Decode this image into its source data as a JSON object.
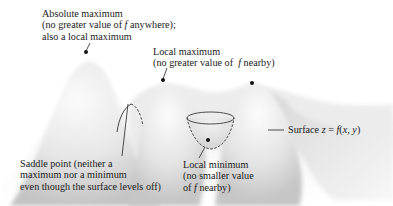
{
  "diagram": {
    "labels": {
      "absolute_max": {
        "lines": [
          "Absolute maximum",
          "(no greater value of f anywhere);",
          "also a local maximum"
        ]
      },
      "local_max": {
        "lines": [
          "Local maximum",
          "(no greater value of  f nearby)"
        ]
      },
      "saddle": {
        "lines": [
          "Saddle point (neither a",
          "maximum nor a minimum",
          "even though the surface levels off)"
        ]
      },
      "local_min": {
        "lines": [
          "Local minimum",
          "(no smaller value",
          "of f nearby)"
        ]
      },
      "surface": {
        "text": "Surface z = f(x, y)"
      }
    },
    "colors": {
      "background": "#ffffff",
      "surface_light": "#f4f4f4",
      "surface_shadow": "#bdbdbd",
      "ink": "#1a1a1a"
    }
  }
}
